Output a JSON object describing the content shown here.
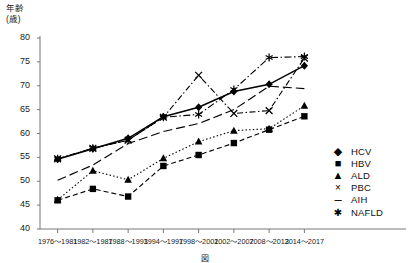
{
  "figure": {
    "caption": "図　　　　　　　",
    "y_axis_title_line1": "年齢",
    "y_axis_title_line2": "(歳)"
  },
  "legend": {
    "position": "right-bottom",
    "entries": [
      {
        "label": "HCV",
        "marker": "diamond",
        "glyph": "◆"
      },
      {
        "label": "HBV",
        "marker": "square",
        "glyph": "■"
      },
      {
        "label": "ALD",
        "marker": "triangle",
        "glyph": "▲"
      },
      {
        "label": "PBC",
        "marker": "x",
        "glyph": "×"
      },
      {
        "label": "AIH",
        "marker": "dash",
        "glyph": "–"
      },
      {
        "label": "NAFLD",
        "marker": "asterisk",
        "glyph": "✱"
      }
    ]
  },
  "chart_data": {
    "type": "line",
    "title": "",
    "xlabel": "",
    "ylabel": "年齢 (歳)",
    "ylim": [
      40,
      80
    ],
    "yticks": [
      40,
      45,
      50,
      55,
      60,
      65,
      70,
      75,
      80
    ],
    "grid": false,
    "categories": [
      "1976～1981",
      "1982～1987",
      "1988～1993",
      "1994～1997",
      "1998～2001",
      "2002～2007",
      "2008～2013",
      "2014～2017"
    ],
    "series": [
      {
        "name": "HCV",
        "marker": "diamond",
        "dash": "solid",
        "values": [
          54.6,
          56.8,
          59.0,
          63.5,
          65.5,
          68.8,
          70.3,
          74.2
        ]
      },
      {
        "name": "HBV",
        "marker": "square",
        "dash": "dashed",
        "values": [
          46.0,
          48.4,
          46.8,
          53.2,
          55.5,
          58.0,
          60.8,
          63.6
        ]
      },
      {
        "name": "ALD",
        "marker": "triangle",
        "dash": "dotted",
        "values": [
          46.1,
          52.2,
          50.3,
          54.8,
          58.3,
          60.6,
          61.0,
          65.8
        ]
      },
      {
        "name": "PBC",
        "marker": "x",
        "dash": "dashdot",
        "values": [
          54.7,
          56.9,
          58.6,
          63.4,
          72.2,
          64.2,
          64.8,
          75.8
        ]
      },
      {
        "name": "AIH",
        "marker": "none",
        "dash": "longdash",
        "values": [
          50.2,
          53.4,
          57.9,
          60.4,
          62.1,
          65.0,
          69.9,
          69.4
        ]
      },
      {
        "name": "NAFLD",
        "marker": "asterisk",
        "dash": "dashdot2",
        "values": [
          54.7,
          56.9,
          58.6,
          63.4,
          64.0,
          69.2,
          75.9,
          76.1
        ]
      }
    ]
  }
}
